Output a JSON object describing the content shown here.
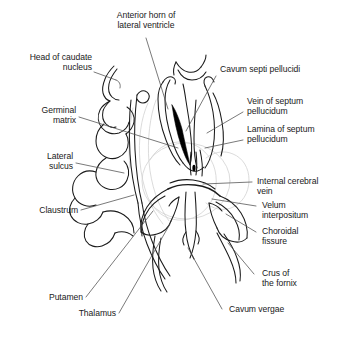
{
  "figure": {
    "type": "labeled-anatomical-line-drawing",
    "width": 343,
    "height": 338,
    "background_color": "#ffffff",
    "line_color": "#1a1a1a",
    "leader_color": "#555555",
    "faint_outline_color": "#cfcfcf",
    "filled_region_color": "#000000"
  },
  "labels": {
    "anterior_horn": "Anterior horn of\nlateral ventricle",
    "head_of_caudate": "Head of caudate\nnucleus",
    "germinal_matrix": "Germinal\nmatrix",
    "lateral_sulcus": "Lateral\nsulcus",
    "claustrum": "Claustrum",
    "putamen": "Putamen",
    "thalamus": "Thalamus",
    "cavum_septi_pellucidi": "Cavum septi pellucidi",
    "vein_of_septum_pellucidum": "Vein of septum\npellucidum",
    "lamina_of_septum_pellucidum": "Lamina of septum\npellucidum",
    "internal_cerebral_vein": "Internal cerebral\nvein",
    "velum_interpositum": "Velum\ninterpositum",
    "choroidal_fissure": "Choroidal\nfissure",
    "crus_of_the_fornix": "Crus of\nthe fornix",
    "cavum_vergae": "Cavum vergae"
  }
}
